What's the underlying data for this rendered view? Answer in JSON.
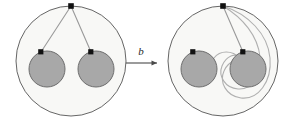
{
  "figure": {
    "title": "Braid generator action on arcs in a twice-punctured disk",
    "background_color": "#ffffff",
    "stroke_color": "#4a4a4a",
    "arc_color": "#9a9a9a",
    "disk_fill": "#a8a8a8",
    "disk_stroke": "#6e6e6e",
    "outer_fill": "#f8f8f6",
    "outer_stroke": "#555555",
    "vertex_color": "#111111"
  },
  "arrow": {
    "label": "b",
    "direction": "right",
    "x1": 126,
    "x2": 160,
    "y": 63
  },
  "panels": [
    {
      "id": "before",
      "name": "left-panel",
      "outer_circle": {
        "cx": 71,
        "cy": 61,
        "r": 55
      },
      "basepoint": {
        "x": 71,
        "y": 6,
        "label": "basepoint"
      },
      "punctures": [
        {
          "id": "puncture-left",
          "cx": 47,
          "cy": 69,
          "r": 18,
          "marker": {
            "x": 41,
            "y": 52
          }
        },
        {
          "id": "puncture-right",
          "cx": 96,
          "cy": 69,
          "r": 18,
          "marker": {
            "x": 91,
            "y": 52
          }
        }
      ],
      "arcs": [
        {
          "id": "arc-to-left-puncture",
          "description": "straight arc from basepoint to left puncture"
        },
        {
          "id": "arc-to-right-puncture",
          "description": "straight arc from basepoint to right puncture"
        }
      ]
    },
    {
      "id": "after",
      "name": "right-panel",
      "outer_circle": {
        "cx": 223,
        "cy": 61,
        "r": 55
      },
      "basepoint": {
        "x": 223,
        "y": 6,
        "label": "basepoint"
      },
      "punctures": [
        {
          "id": "puncture-left",
          "cx": 199,
          "cy": 69,
          "r": 18,
          "marker": {
            "x": 193,
            "y": 52
          }
        },
        {
          "id": "puncture-right",
          "cx": 248,
          "cy": 69,
          "r": 18,
          "marker": {
            "x": 243,
            "y": 52
          }
        }
      ],
      "arcs": [
        {
          "id": "arc-to-right-puncture",
          "description": "straight arc from basepoint to right puncture"
        },
        {
          "id": "arc-twisted-s-curve",
          "description": "S-shaped arc looping around the right puncture then to the left puncture"
        },
        {
          "id": "arc-outer-loop",
          "description": "arc from basepoint sweeping around the right puncture"
        }
      ]
    }
  ],
  "caption": ""
}
